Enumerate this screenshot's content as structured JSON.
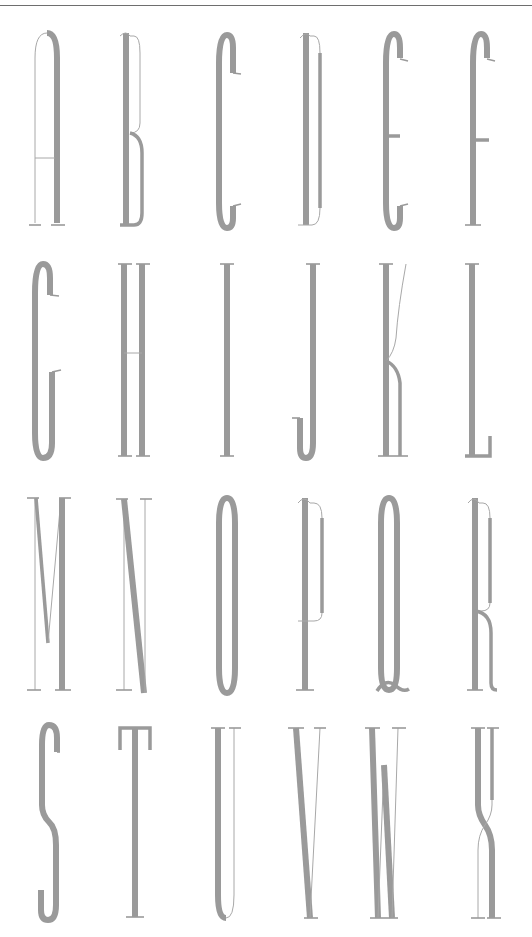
{
  "specimen": {
    "ink_color": "#9a9a9a",
    "rule_color": "#6e6e6e",
    "background": "#ffffff",
    "rows": [
      {
        "letters": [
          "A",
          "B",
          "C",
          "D",
          "E",
          "F"
        ]
      },
      {
        "letters": [
          "G",
          "H",
          "I",
          "J",
          "K",
          "L"
        ]
      },
      {
        "letters": [
          "M",
          "N",
          "O",
          "P",
          "Q",
          "R"
        ]
      },
      {
        "letters": [
          "S",
          "T",
          "U",
          "V",
          "W",
          "X"
        ]
      }
    ]
  }
}
